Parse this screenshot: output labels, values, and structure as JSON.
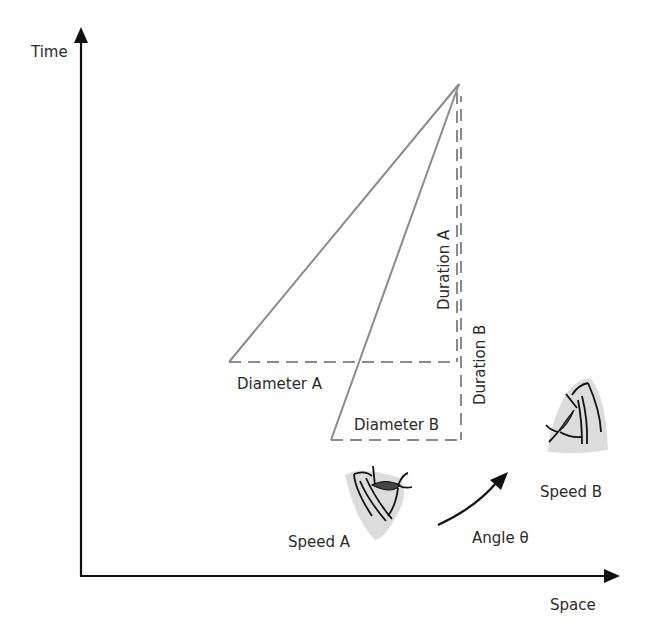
{
  "axes": {
    "y_label": "Time",
    "x_label": "Space"
  },
  "labels": {
    "diameter_a": "Diameter A",
    "diameter_b": "Diameter B",
    "duration_a": "Duration A",
    "duration_b": "Duration B",
    "speed_a": "Speed  A",
    "speed_b": "Speed B",
    "angle": "Angle θ"
  },
  "icons": {
    "eye_speed_a": "eye-profile-icon",
    "eye_speed_b": "eye-profile-icon",
    "angle_arrow": "curved-arrow-icon"
  },
  "colors": {
    "axis": "#111111",
    "lines": "#8a8a8a",
    "text": "#2a2a2a",
    "eye_shadow": "#d9d9d9"
  }
}
